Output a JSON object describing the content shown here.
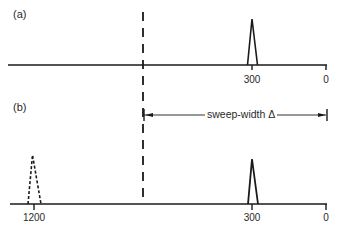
{
  "panels": [
    {
      "label": "(a)",
      "axis": {
        "ticks": [
          {
            "value": "300"
          },
          {
            "value": "0"
          }
        ]
      },
      "peaks": [
        {
          "position": "300",
          "style": "solid"
        }
      ]
    },
    {
      "label": "(b)",
      "axis": {
        "ticks": [
          {
            "value": "1200"
          },
          {
            "value": "300"
          },
          {
            "value": "0"
          }
        ]
      },
      "peaks": [
        {
          "position": "1200",
          "style": "dotted"
        },
        {
          "position": "300",
          "style": "solid"
        }
      ]
    }
  ],
  "annotation": {
    "sweep_width_label": "sweep-width Δ"
  },
  "colors": {
    "line": "#1a1a1a",
    "background": "#ffffff"
  }
}
